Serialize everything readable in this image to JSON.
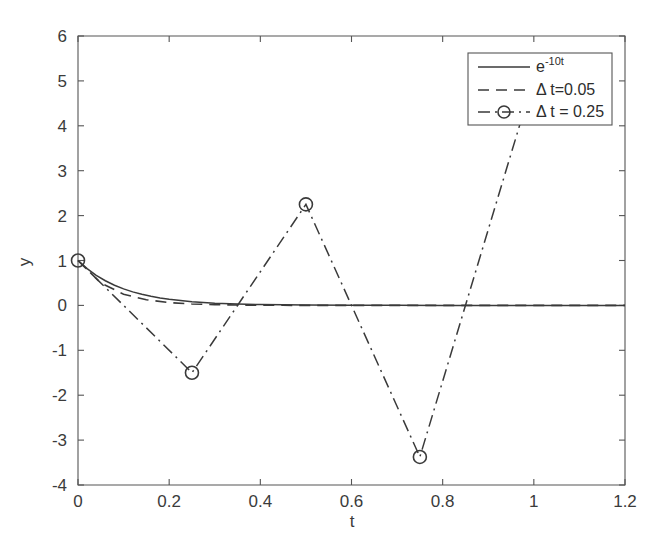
{
  "chart_data": {
    "type": "line",
    "title": "",
    "xlabel": "t",
    "ylabel": "y",
    "xlim": [
      0,
      1.2
    ],
    "ylim": [
      -4,
      6
    ],
    "xticks": [
      "0",
      "0.2",
      "0.4",
      "0.6",
      "0.8",
      "1",
      "1.2"
    ],
    "xtick_values": [
      0,
      0.2,
      0.4,
      0.6,
      0.8,
      1,
      1.2
    ],
    "yticks": [
      "6",
      "5",
      "4",
      "3",
      "2",
      "1",
      "0",
      "-1",
      "-2",
      "-3",
      "-4"
    ],
    "ytick_values": [
      6,
      5,
      4,
      3,
      2,
      1,
      0,
      -1,
      -2,
      -3,
      -4
    ],
    "grid": false,
    "legend_position": "upper right",
    "series": [
      {
        "name": "e^{-10t}",
        "legend_label_base": "e",
        "legend_label_sup": "-10t",
        "style": "solid",
        "marker": "none",
        "color": "#3a3a3a",
        "x": [
          0,
          0.02,
          0.04,
          0.06,
          0.08,
          0.1,
          0.12,
          0.14,
          0.16,
          0.18,
          0.2,
          0.25,
          0.3,
          0.35,
          0.4,
          0.5,
          0.6,
          0.7,
          0.8,
          0.9,
          1.0,
          1.1,
          1.2
        ],
        "y": [
          1,
          0.8187,
          0.6703,
          0.5488,
          0.4493,
          0.3679,
          0.3012,
          0.2466,
          0.2019,
          0.1653,
          0.1353,
          0.0821,
          0.0498,
          0.0302,
          0.0183,
          0.0067,
          0.0025,
          0.0009,
          0.0003,
          0.0001,
          0.0,
          0.0,
          0.0
        ]
      },
      {
        "name": "Delta t=0.05",
        "legend_label": "Δ t=0.05",
        "style": "dashed",
        "marker": "none",
        "color": "#3a3a3a",
        "x": [
          0,
          0.05,
          0.1,
          0.15,
          0.2,
          0.25,
          0.3,
          0.35,
          0.4,
          0.45,
          0.5,
          0.6,
          0.7,
          0.8,
          0.9,
          1.0,
          1.1,
          1.2
        ],
        "y": [
          1,
          0.5,
          0.25,
          0.125,
          0.0625,
          0.03125,
          0.015625,
          0.0078,
          0.0039,
          0.002,
          0.001,
          0.0002,
          0.0001,
          0.0,
          0.0,
          0.0,
          0.0,
          0.0
        ]
      },
      {
        "name": "Delta t = 0.25",
        "legend_label": "Δ t = 0.25",
        "style": "dashdot",
        "marker": "circle",
        "color": "#3a3a3a",
        "x": [
          0,
          0.25,
          0.5,
          0.75,
          1.0
        ],
        "y": [
          1,
          -1.5,
          2.25,
          -3.375,
          5.0625
        ]
      }
    ]
  }
}
